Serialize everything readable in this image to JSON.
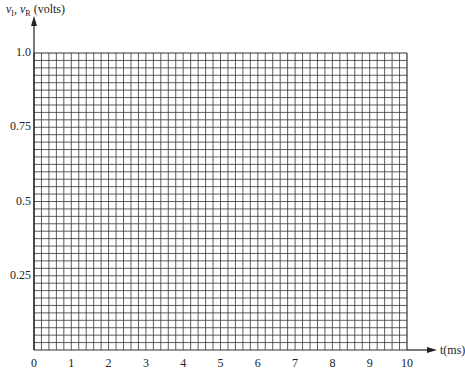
{
  "chart_data": {
    "type": "line",
    "title": "",
    "xlabel": "t(ms)",
    "ylabel": "v_I, v_R (volts)",
    "ylabel_parts": {
      "v1": "v",
      "sub1": "I",
      "sep": ", ",
      "v2": "v",
      "sub2": "R",
      "unit": " (volts)"
    },
    "xlim": [
      0,
      10
    ],
    "ylim": [
      0,
      1.0
    ],
    "x_ticks": [
      "0",
      "1",
      "2",
      "3",
      "4",
      "5",
      "6",
      "7",
      "8",
      "9",
      "10"
    ],
    "y_ticks": [
      "1.0",
      "0.75",
      "0.5",
      "0.25"
    ],
    "y_tick_values": [
      1.0,
      0.75,
      0.5,
      0.25
    ],
    "grid": true,
    "grid_minor_x_per_unit": 5,
    "grid_minor_y_per_0_25": 10,
    "series": []
  },
  "colors": {
    "grid": "#333333",
    "background": "#ffffff",
    "text": "#222222"
  }
}
